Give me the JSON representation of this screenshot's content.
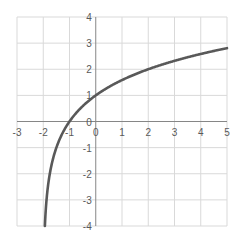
{
  "chart_data": {
    "type": "line",
    "title": "",
    "xlabel": "",
    "ylabel": "",
    "xlim": [
      -3,
      5
    ],
    "ylim": [
      -4,
      4
    ],
    "grid": true,
    "legend": null,
    "x_ticks": [
      -3,
      -2,
      -1,
      0,
      1,
      2,
      3,
      4,
      5
    ],
    "y_ticks": [
      -4,
      -3,
      -2,
      -1,
      0,
      1,
      2,
      3,
      4
    ],
    "function_hint": "y = log2(x + 2)",
    "series": [
      {
        "name": "curve",
        "x": [
          -1.9375,
          -1.875,
          -1.75,
          -1.5,
          -1.25,
          -1,
          -0.5,
          0,
          0.5,
          1,
          1.5,
          2,
          2.5,
          3,
          3.5,
          4,
          4.5,
          5
        ],
        "y": [
          -4,
          -3,
          -2,
          -1,
          -0.415,
          0,
          0.585,
          1,
          1.322,
          1.585,
          1.807,
          2,
          2.17,
          2.322,
          2.459,
          2.585,
          2.7,
          2.807
        ]
      }
    ]
  },
  "colors": {
    "grid": "#d9d9d9",
    "axis": "#868686",
    "curve": "#595959",
    "label": "#595959"
  },
  "layout": {
    "plot_left": 17,
    "plot_right": 227,
    "plot_top": 17,
    "plot_bottom": 226
  }
}
